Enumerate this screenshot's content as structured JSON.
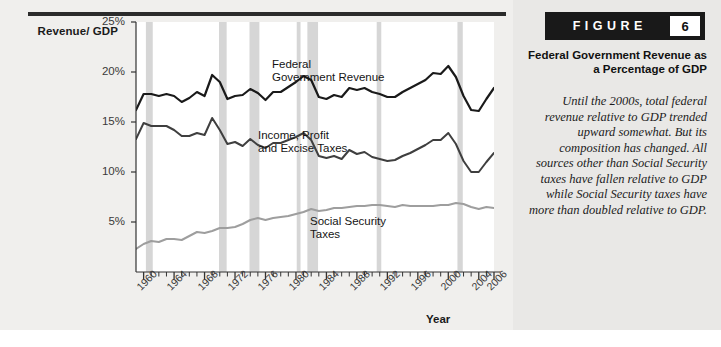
{
  "figure": {
    "badge_word": "FIGURE",
    "badge_number": "6",
    "title": "Federal Government Revenue as a Percentage of GDP",
    "caption": "Until the 2000s, total federal revenue relative to GDP trended upward somewhat. But its composition has changed. All sources other than Social Security taxes have fallen relative to GDP while Social Security taxes have more than doubled relative to GDP."
  },
  "colors": {
    "page_background": "#f0efed",
    "caption_background": "#e9e8e6",
    "plot_background": "#ffffff",
    "rule": "#2b2b2b",
    "recession_band": "#d6d6d6",
    "total_revenue_line": "#1a1a1a",
    "income_tax_line": "#3f3f3f",
    "social_security_line": "#9e9e9e",
    "badge_background": "#191919",
    "badge_number_background": "#ffffff"
  },
  "chart_data": {
    "type": "line",
    "title": "Federal Government Revenue as a Percentage of GDP",
    "xlabel": "Year",
    "ylabel": "Revenue/ GDP",
    "xlim": [
      1959,
      2006
    ],
    "ylim": [
      0,
      25
    ],
    "grid": false,
    "legend_position": "inline-annotations",
    "ytick_labels": [
      "25%",
      "20%",
      "15%",
      "10%",
      "5%"
    ],
    "ytick_values": [
      25,
      20,
      15,
      10,
      5
    ],
    "xtick_labels": [
      "1960",
      "1964",
      "1968",
      "1972",
      "1976",
      "1980",
      "1984",
      "1988",
      "1992",
      "1996",
      "2000",
      "2004",
      "2006"
    ],
    "xtick_values": [
      1960,
      1964,
      1968,
      1972,
      1976,
      1980,
      1984,
      1988,
      1992,
      1996,
      2000,
      2004,
      2006
    ],
    "x": [
      1959,
      1960,
      1961,
      1962,
      1963,
      1964,
      1965,
      1966,
      1967,
      1968,
      1969,
      1970,
      1971,
      1972,
      1973,
      1974,
      1975,
      1976,
      1977,
      1978,
      1979,
      1980,
      1981,
      1982,
      1983,
      1984,
      1985,
      1986,
      1987,
      1988,
      1989,
      1990,
      1991,
      1992,
      1993,
      1994,
      1995,
      1996,
      1997,
      1998,
      1999,
      2000,
      2001,
      2002,
      2003,
      2004,
      2005,
      2006
    ],
    "series": [
      {
        "name": "Federal Government Revenue",
        "color": "#1a1a1a",
        "label_text": "Federal\nGovernment Revenue",
        "values": [
          16.2,
          17.8,
          17.8,
          17.6,
          17.8,
          17.6,
          17.0,
          17.4,
          18.0,
          17.6,
          19.7,
          19.0,
          17.3,
          17.6,
          17.7,
          18.3,
          17.9,
          17.2,
          18.0,
          18.0,
          18.5,
          19.0,
          19.6,
          19.2,
          17.5,
          17.3,
          17.7,
          17.5,
          18.4,
          18.2,
          18.4,
          18.0,
          17.8,
          17.5,
          17.5,
          18.0,
          18.4,
          18.8,
          19.2,
          19.9,
          19.8,
          20.6,
          19.5,
          17.6,
          16.2,
          16.1,
          17.3,
          18.4
        ]
      },
      {
        "name": "Income, Profit and Excise Taxes",
        "color": "#3f3f3f",
        "label_text": "Income, Profit\nand Excise Taxes",
        "values": [
          13.3,
          14.9,
          14.6,
          14.6,
          14.6,
          14.2,
          13.6,
          13.6,
          13.9,
          13.7,
          15.4,
          14.2,
          12.8,
          13.0,
          12.6,
          13.3,
          12.7,
          12.4,
          12.9,
          12.9,
          13.2,
          13.5,
          13.9,
          13.2,
          11.6,
          11.4,
          11.6,
          11.3,
          12.2,
          11.8,
          12.0,
          11.5,
          11.3,
          11.1,
          11.2,
          11.6,
          11.9,
          12.3,
          12.7,
          13.2,
          13.2,
          13.9,
          12.8,
          11.1,
          10.0,
          10.0,
          11.0,
          11.9
        ]
      },
      {
        "name": "Social Security Taxes",
        "color": "#9e9e9e",
        "label_text": "Social Security\nTaxes",
        "values": [
          2.3,
          2.8,
          3.1,
          3.0,
          3.3,
          3.3,
          3.2,
          3.6,
          4.0,
          3.9,
          4.1,
          4.4,
          4.4,
          4.5,
          4.8,
          5.2,
          5.4,
          5.2,
          5.4,
          5.5,
          5.6,
          5.8,
          6.0,
          6.3,
          6.1,
          6.2,
          6.4,
          6.4,
          6.5,
          6.6,
          6.6,
          6.7,
          6.7,
          6.6,
          6.5,
          6.7,
          6.6,
          6.6,
          6.6,
          6.6,
          6.7,
          6.7,
          6.9,
          6.8,
          6.5,
          6.3,
          6.5,
          6.4
        ]
      }
    ],
    "recession_bands": [
      {
        "start": 1960.3,
        "end": 1961.2
      },
      {
        "start": 1969.9,
        "end": 1970.9
      },
      {
        "start": 1973.9,
        "end": 1975.2
      },
      {
        "start": 1980.1,
        "end": 1980.6
      },
      {
        "start": 1981.5,
        "end": 1982.9
      },
      {
        "start": 1990.6,
        "end": 1991.2
      },
      {
        "start": 2001.2,
        "end": 2001.9
      }
    ]
  }
}
